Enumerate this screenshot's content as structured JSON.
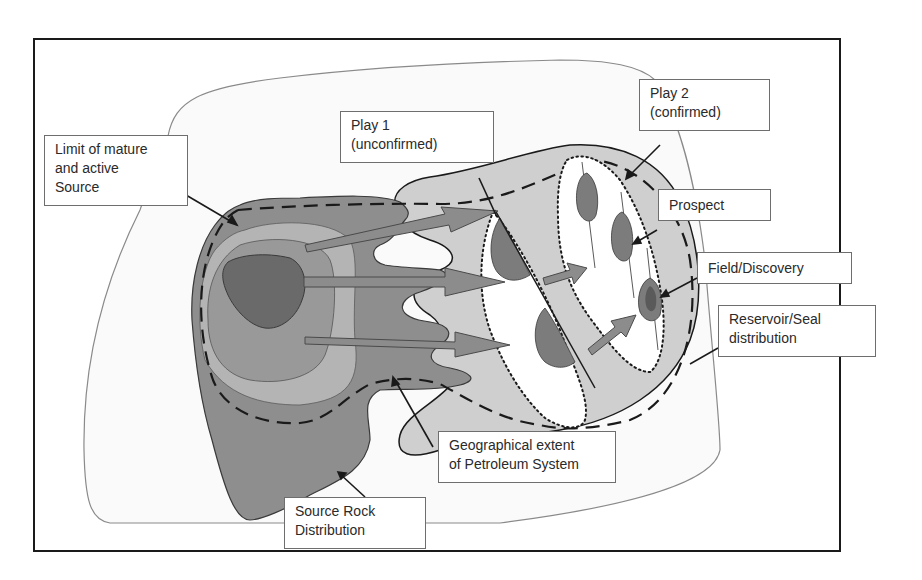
{
  "diagram": {
    "type": "petroleum-system-schematic",
    "labels": {
      "limit_source": {
        "line1": "Limit of mature",
        "line2": "and active",
        "line3": "Source"
      },
      "play1": {
        "line1": "Play 1",
        "line2": "(unconfirmed)"
      },
      "play2": {
        "line1": "Play 2",
        "line2": "(confirmed)"
      },
      "prospect": {
        "line1": "Prospect"
      },
      "field_discovery": {
        "line1": "Field/Discovery"
      },
      "reservoir_seal": {
        "line1": "Reservoir/Seal",
        "line2": "distribution"
      },
      "geographical_extent": {
        "line1": "Geographical extent",
        "line2": "of Petroleum System"
      },
      "source_rock": {
        "line1": "Source Rock",
        "line2": "Distribution"
      }
    },
    "colors": {
      "frame": "#1a1a1a",
      "basin_outline": "#8a8a8a",
      "source_outer": "#8e8e8e",
      "source_ring_light": "#b4b4b4",
      "source_mid": "#999999",
      "source_core": "#6a6a6a",
      "reservoir_fill": "#cfcfcf",
      "trap_fill": "#7c7c7c",
      "migration_arrow": "#8c8c8c",
      "label_border": "#6e6e6e"
    }
  }
}
